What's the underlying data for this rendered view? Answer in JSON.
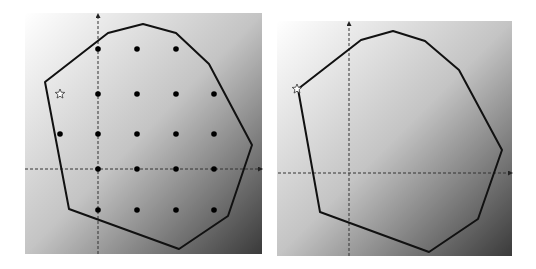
{
  "figure": {
    "background_gradient": {
      "from": "#ffffff",
      "to": "#3a3a3a"
    },
    "polygon_color": "#111111",
    "axis_color": "#333333"
  },
  "panels": [
    {
      "name": "left",
      "bg": {
        "x": 25,
        "y": 13,
        "w": 237,
        "h": 241
      },
      "axes": {
        "h_y": 169,
        "h_x1": 25,
        "h_x2": 262,
        "v_x": 98,
        "v_y1": 14,
        "v_y2": 254
      },
      "polygon": [
        [
          45,
          82
        ],
        [
          108,
          33
        ],
        [
          143,
          24
        ],
        [
          176,
          33
        ],
        [
          209,
          64
        ],
        [
          252,
          145
        ],
        [
          228,
          216
        ],
        [
          179,
          249
        ],
        [
          69,
          209
        ]
      ],
      "points": [
        [
          98,
          49
        ],
        [
          137,
          49
        ],
        [
          176,
          49
        ],
        [
          98,
          94
        ],
        [
          137,
          94
        ],
        [
          176,
          94
        ],
        [
          214,
          94
        ],
        [
          60,
          134
        ],
        [
          98,
          134
        ],
        [
          137,
          134
        ],
        [
          176,
          134
        ],
        [
          214,
          134
        ],
        [
          98,
          169
        ],
        [
          137,
          169
        ],
        [
          176,
          169
        ],
        [
          214,
          169
        ],
        [
          98,
          210
        ],
        [
          137,
          210
        ],
        [
          176,
          210
        ],
        [
          214,
          210
        ]
      ],
      "star": {
        "x": 60,
        "y": 94,
        "filled": false
      }
    },
    {
      "name": "right",
      "bg": {
        "x": 277,
        "y": 21,
        "w": 235,
        "h": 235
      },
      "axes": {
        "h_y": 173,
        "h_x1": 278,
        "h_x2": 512,
        "v_x": 349,
        "v_y1": 22,
        "v_y2": 256
      },
      "polygon": [
        [
          298,
          89
        ],
        [
          361,
          40
        ],
        [
          393,
          31
        ],
        [
          425,
          41
        ],
        [
          459,
          70
        ],
        [
          502,
          150
        ],
        [
          478,
          219
        ],
        [
          429,
          252
        ],
        [
          320,
          212
        ]
      ],
      "points": [],
      "star": {
        "x": 297,
        "y": 89,
        "filled": false
      }
    }
  ]
}
